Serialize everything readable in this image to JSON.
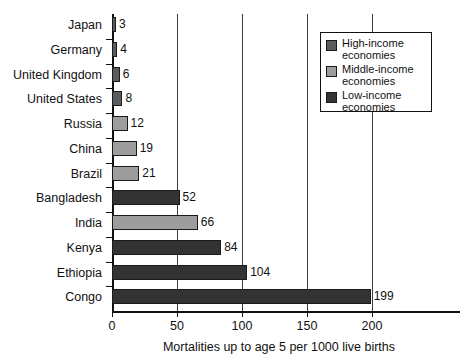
{
  "chart_data": {
    "type": "bar",
    "orientation": "horizontal",
    "title": "",
    "xlabel": "Mortalities up to age 5 per 1000 live births",
    "ylabel": "",
    "xlim": [
      0,
      200
    ],
    "xticks": [
      0,
      50,
      100,
      150,
      200
    ],
    "xtick_labels": [
      "0",
      "50",
      "100",
      "150",
      "200"
    ],
    "grid": true,
    "grid_axis": "x",
    "legend_position": "top-right",
    "categories": [
      "Japan",
      "Germany",
      "United Kingdom",
      "United States",
      "Russia",
      "China",
      "Brazil",
      "Bangladesh",
      "India",
      "Kenya",
      "Ethiopia",
      "Congo"
    ],
    "values": [
      3,
      4,
      6,
      8,
      12,
      19,
      21,
      52,
      66,
      84,
      104,
      199
    ],
    "value_labels": [
      "3",
      "4",
      "6",
      "8",
      "12",
      "19",
      "21",
      "52",
      "66",
      "84",
      "104",
      "199"
    ],
    "groups": [
      "high",
      "high",
      "high",
      "high",
      "middle",
      "middle",
      "middle",
      "low",
      "middle",
      "low",
      "low",
      "low"
    ],
    "series": [
      {
        "name": "High-income economies",
        "key": "high",
        "color": "#5b5b5b",
        "points": [
          {
            "category": "Japan",
            "value": 3
          },
          {
            "category": "Germany",
            "value": 4
          },
          {
            "category": "United Kingdom",
            "value": 6
          },
          {
            "category": "United States",
            "value": 8
          }
        ]
      },
      {
        "name": "Middle-income economies",
        "key": "middle",
        "color": "#9d9d9d",
        "points": [
          {
            "category": "Russia",
            "value": 12
          },
          {
            "category": "China",
            "value": 19
          },
          {
            "category": "Brazil",
            "value": 21
          },
          {
            "category": "India",
            "value": 66
          }
        ]
      },
      {
        "name": "Low-income economies",
        "key": "low",
        "color": "#333333",
        "points": [
          {
            "category": "Bangladesh",
            "value": 52
          },
          {
            "category": "Kenya",
            "value": 84
          },
          {
            "category": "Ethiopia",
            "value": 104
          },
          {
            "category": "Congo",
            "value": 199
          }
        ]
      }
    ],
    "legend": [
      {
        "key": "high",
        "line1": "High-income",
        "line2": "economies",
        "color": "#5b5b5b"
      },
      {
        "key": "middle",
        "line1": "Middle-income",
        "line2": "economies",
        "color": "#9d9d9d"
      },
      {
        "key": "low",
        "line1": "Low-income",
        "line2": "economies",
        "color": "#333333"
      }
    ]
  }
}
